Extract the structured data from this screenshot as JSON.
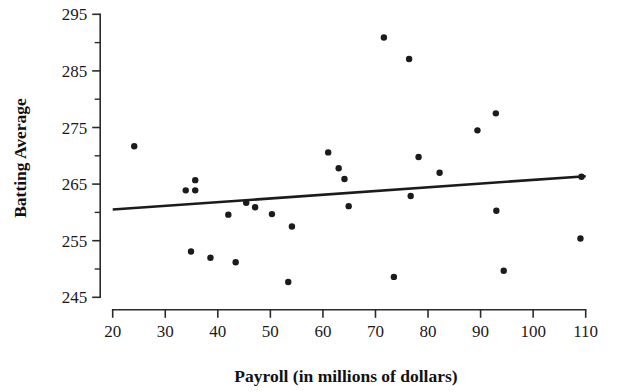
{
  "chart_data": {
    "type": "scatter",
    "title": "",
    "xlabel": "Payroll (in millions of dollars)",
    "ylabel": "Batting Average",
    "xlim": [
      20,
      110
    ],
    "ylim": [
      245,
      295
    ],
    "xticks": [
      20,
      30,
      40,
      50,
      60,
      70,
      80,
      90,
      100,
      110
    ],
    "yticks": [
      245,
      255,
      265,
      275,
      285,
      295
    ],
    "xtick_labels": [
      "20",
      "30",
      "40",
      "50",
      "60",
      "70",
      "80",
      "90",
      "100",
      "110"
    ],
    "ytick_labels": [
      "245",
      "255",
      "265",
      "275",
      "285",
      "295"
    ],
    "x_minor_tick_step": 5,
    "y_minor_tick_step": 5,
    "grid": false,
    "legend": false,
    "marker": "filled-circle",
    "marker_color": "#1b1b1b",
    "marker_radius": 3.2,
    "points": [
      {
        "x": 24.1,
        "y": 271.7
      },
      {
        "x": 33.9,
        "y": 263.9
      },
      {
        "x": 34.9,
        "y": 253.1
      },
      {
        "x": 35.7,
        "y": 265.7
      },
      {
        "x": 35.7,
        "y": 263.9
      },
      {
        "x": 38.6,
        "y": 252.0
      },
      {
        "x": 42.0,
        "y": 259.6
      },
      {
        "x": 43.4,
        "y": 251.2
      },
      {
        "x": 45.4,
        "y": 261.7
      },
      {
        "x": 47.1,
        "y": 260.9
      },
      {
        "x": 50.3,
        "y": 259.7
      },
      {
        "x": 53.4,
        "y": 247.7
      },
      {
        "x": 54.1,
        "y": 257.5
      },
      {
        "x": 61.0,
        "y": 270.6
      },
      {
        "x": 63.0,
        "y": 267.8
      },
      {
        "x": 64.1,
        "y": 265.9
      },
      {
        "x": 64.9,
        "y": 261.1
      },
      {
        "x": 71.6,
        "y": 290.9
      },
      {
        "x": 73.5,
        "y": 248.6
      },
      {
        "x": 76.4,
        "y": 287.1
      },
      {
        "x": 76.7,
        "y": 262.9
      },
      {
        "x": 78.2,
        "y": 269.8
      },
      {
        "x": 82.2,
        "y": 267.0
      },
      {
        "x": 89.4,
        "y": 274.5
      },
      {
        "x": 92.9,
        "y": 277.5
      },
      {
        "x": 93.0,
        "y": 260.3
      },
      {
        "x": 94.4,
        "y": 249.7
      },
      {
        "x": 109.2,
        "y": 266.3
      },
      {
        "x": 109.0,
        "y": 255.4
      }
    ],
    "trend_line": {
      "label": "least-squares regression line",
      "color": "#1b1b1b",
      "x_start": 20,
      "y_start": 260.5,
      "x_end": 110,
      "y_end": 266.4
    }
  }
}
